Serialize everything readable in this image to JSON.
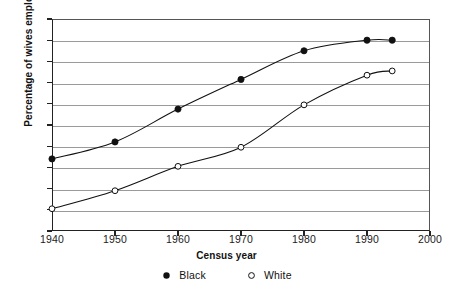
{
  "chart_data": {
    "type": "line",
    "title": "",
    "xlabel": "Census year",
    "ylabel": "Percentage of wives employed",
    "xlim": [
      1940,
      2000
    ],
    "ylim": [
      0,
      100
    ],
    "grid": true,
    "legend_position": "bottom-center",
    "x_ticks": [
      "1940",
      "1950",
      "1960",
      "1970",
      "1980",
      "1990",
      "2000"
    ],
    "x_tick_values": [
      1940,
      1950,
      1960,
      1970,
      1980,
      1990,
      2000
    ],
    "y_ticks": [
      "0",
      "10",
      "20",
      "30",
      "40",
      "50",
      "60",
      "70",
      "80",
      "90",
      "100"
    ],
    "y_tick_values": [
      0,
      10,
      20,
      30,
      40,
      50,
      60,
      70,
      80,
      90,
      100
    ],
    "series": [
      {
        "name": "Black",
        "marker": "filled-circle",
        "color": "#111111",
        "x": [
          1940,
          1950,
          1960,
          1970,
          1980,
          1990,
          1994
        ],
        "values": [
          34,
          42,
          57.5,
          71.5,
          85,
          90,
          90
        ]
      },
      {
        "name": "White",
        "marker": "open-circle",
        "color": "#111111",
        "x": [
          1940,
          1950,
          1960,
          1970,
          1980,
          1990,
          1994
        ],
        "values": [
          10.5,
          19,
          30.5,
          39.5,
          59.5,
          73.5,
          75.5
        ]
      }
    ]
  },
  "legend": {
    "items": [
      {
        "label": "Black",
        "marker": "filled-circle-icon"
      },
      {
        "label": "White",
        "marker": "open-circle-icon"
      }
    ]
  },
  "colors": {
    "ink": "#111111",
    "grid": "#9a9a9a",
    "axis": "#222222",
    "background": "#ffffff"
  }
}
